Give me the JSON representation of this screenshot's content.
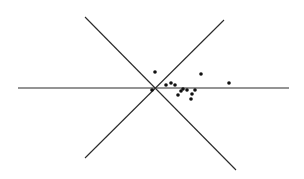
{
  "diagram": {
    "background": "#ffffff",
    "stroke_color": "#2a2a2a",
    "dot_color": "#111111",
    "lines": [
      {
        "name": "horizontal-axis-line",
        "x1": 18,
        "y1": 88,
        "x2": 289,
        "y2": 88
      },
      {
        "name": "diagonal-line-down",
        "x1": 85,
        "y1": 17,
        "x2": 236,
        "y2": 170
      },
      {
        "name": "diagonal-line-up",
        "x1": 224,
        "y1": 20,
        "x2": 85,
        "y2": 158
      }
    ],
    "points": [
      {
        "x": 155,
        "y": 72
      },
      {
        "x": 201,
        "y": 74
      },
      {
        "x": 229,
        "y": 83
      },
      {
        "x": 152,
        "y": 90
      },
      {
        "x": 166,
        "y": 85
      },
      {
        "x": 171,
        "y": 83
      },
      {
        "x": 175,
        "y": 85
      },
      {
        "x": 178,
        "y": 95
      },
      {
        "x": 181,
        "y": 91
      },
      {
        "x": 183,
        "y": 89
      },
      {
        "x": 187,
        "y": 90
      },
      {
        "x": 191,
        "y": 99
      },
      {
        "x": 192,
        "y": 94
      },
      {
        "x": 195,
        "y": 90
      }
    ],
    "point_radius": 1.8
  }
}
